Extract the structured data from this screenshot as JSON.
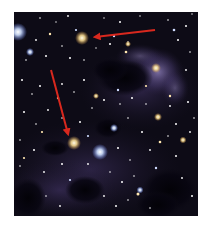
{
  "image": {
    "subject": "star field with dark nebula clouds and bluish reflection nebula",
    "background_color": "#0c0a14",
    "nebula_color": "#6a5a9a",
    "dark_cloud_color": "#050309"
  },
  "annotations": [
    {
      "type": "arrow",
      "color": "#d8281e",
      "from": [
        155,
        30
      ],
      "to": [
        94,
        37
      ],
      "points_at": "yellow star"
    },
    {
      "type": "arrow",
      "color": "#d8281e",
      "from": [
        51,
        70
      ],
      "to": [
        69,
        136
      ],
      "points_at": "yellow star"
    }
  ],
  "highlighted_stars": [
    {
      "x": 82,
      "y": 38,
      "color": "#f4d890",
      "r": 5
    },
    {
      "x": 74,
      "y": 143,
      "color": "#f6dca0",
      "r": 5
    }
  ],
  "bright_stars": [
    {
      "x": 18,
      "y": 32,
      "color": "#cfe0ff",
      "r": 7
    },
    {
      "x": 100,
      "y": 152,
      "color": "#d8e6ff",
      "r": 6
    },
    {
      "x": 114,
      "y": 128,
      "color": "#d0ddff",
      "r": 3
    },
    {
      "x": 156,
      "y": 68,
      "color": "#fff0c0",
      "r": 4
    },
    {
      "x": 158,
      "y": 117,
      "color": "#f4d8a0",
      "r": 3
    },
    {
      "x": 183,
      "y": 140,
      "color": "#f0d8a0",
      "r": 3
    },
    {
      "x": 30,
      "y": 52,
      "color": "#e0e8ff",
      "r": 3
    },
    {
      "x": 96,
      "y": 96,
      "color": "#f0c890",
      "r": 2
    },
    {
      "x": 140,
      "y": 190,
      "color": "#e0e8ff",
      "r": 3
    },
    {
      "x": 195,
      "y": 165,
      "color": "#ffffff",
      "r": 2
    }
  ]
}
